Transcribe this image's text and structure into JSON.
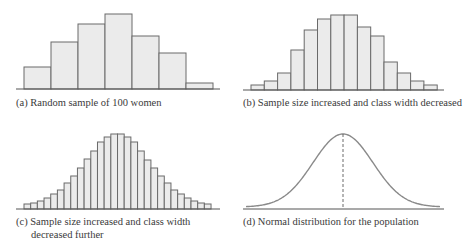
{
  "colors": {
    "bar_fill": "#ebebeb",
    "bar_edge": "#6a6a6a",
    "axis": "#555555",
    "curve": "#8a8a8a",
    "dashed": "#6a6a6a"
  },
  "captions": {
    "a": "(a) Random sample of 100 women",
    "b": "(b) Sample size increased and class width decreased",
    "c_line1": "(c) Sample size increased and class width",
    "c_line2": "decreased further",
    "d": "(d) Normal distribution for the population"
  },
  "chart_data": [
    {
      "id": "a",
      "type": "bar",
      "title": "(a) Random sample of 100 women",
      "xlabel": "",
      "ylabel": "",
      "grid": false,
      "categories": [
        "1",
        "2",
        "3",
        "4",
        "5",
        "6",
        "7"
      ],
      "values": [
        7,
        15,
        21,
        25,
        18,
        12,
        2
      ],
      "pixel_heights": [
        22,
        47,
        65,
        75,
        53,
        36,
        6
      ]
    },
    {
      "id": "b",
      "type": "bar",
      "title": "(b) Sample size increased and class width decreased",
      "xlabel": "",
      "ylabel": "",
      "grid": false,
      "categories": [
        "1",
        "2",
        "3",
        "4",
        "5",
        "6",
        "7",
        "8",
        "9",
        "10",
        "11",
        "12",
        "13",
        "14"
      ],
      "values": [
        5,
        9,
        17,
        40,
        60,
        71,
        75,
        75,
        63,
        54,
        28,
        17,
        9,
        5
      ],
      "pixel_heights": [
        5,
        9,
        17,
        40,
        60,
        71,
        75,
        75,
        63,
        54,
        28,
        17,
        9,
        5
      ]
    },
    {
      "id": "c",
      "type": "bar",
      "title": "(c) Sample size increased and class width decreased further",
      "xlabel": "",
      "ylabel": "",
      "grid": false,
      "categories": [
        "1",
        "2",
        "3",
        "4",
        "5",
        "6",
        "7",
        "8",
        "9",
        "10",
        "11",
        "12",
        "13",
        "14",
        "15",
        "16",
        "17",
        "18",
        "19",
        "20",
        "21",
        "22",
        "23",
        "24",
        "25",
        "26",
        "27",
        "28"
      ],
      "values": [
        5,
        6,
        8,
        11,
        15,
        19,
        26,
        33,
        41,
        50,
        58,
        67,
        72,
        75,
        75,
        72,
        67,
        58,
        49,
        41,
        33,
        26,
        19,
        15,
        11,
        8,
        6,
        5
      ],
      "pixel_heights": [
        5,
        6,
        8,
        11,
        15,
        19,
        26,
        33,
        41,
        50,
        58,
        67,
        72,
        75,
        75,
        72,
        67,
        58,
        49,
        41,
        33,
        26,
        19,
        15,
        11,
        8,
        6,
        5
      ]
    },
    {
      "id": "d",
      "type": "line",
      "title": "(d) Normal distribution for the population",
      "xlabel": "",
      "ylabel": "",
      "grid": false,
      "curve": "normal",
      "mean_marker": "dashed vertical line at peak",
      "peak_height_px": 75
    }
  ]
}
